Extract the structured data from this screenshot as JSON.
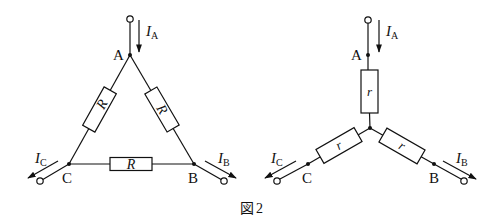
{
  "figure": {
    "caption": "図 2",
    "caption_prefix": "図",
    "caption_number": "2",
    "stroke_color": "#111111",
    "background": "#ffffff"
  },
  "delta_circuit": {
    "nodes": {
      "A": "A",
      "B": "B",
      "C": "C"
    },
    "resistors": {
      "AB": "R",
      "AC": "R",
      "BC": "R"
    },
    "currents": {
      "A": {
        "symbol": "I",
        "subscript": "A"
      },
      "B": {
        "symbol": "I",
        "subscript": "B"
      },
      "C": {
        "symbol": "I",
        "subscript": "C"
      }
    }
  },
  "star_circuit": {
    "nodes": {
      "A": "A",
      "B": "B",
      "C": "C"
    },
    "resistors": {
      "A": "r",
      "B": "r",
      "C": "r"
    },
    "currents": {
      "A": {
        "symbol": "I",
        "subscript": "A"
      },
      "B": {
        "symbol": "I",
        "subscript": "B"
      },
      "C": {
        "symbol": "I",
        "subscript": "C"
      }
    }
  }
}
